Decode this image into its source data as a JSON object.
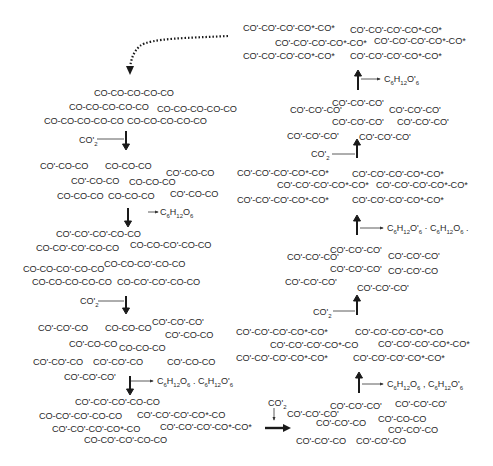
{
  "diagram": {
    "type": "reaction-scheme",
    "colors": {
      "text": "#2a2a2a",
      "arrows": "#1a1a1a",
      "background": "#ffffff"
    }
  },
  "left_column": {
    "block1": [
      "CO-CO-CO-CO-CO",
      "CO-CO-CO-CO-CO",
      "CO-CO-CO-CO-CO",
      "CO-CO-CO-CO-CO",
      "CO-CO-CO-CO-CO"
    ],
    "step1_reagent": "CO'",
    "step1_reagent_sub": "2",
    "block2": [
      "CO'-CO-CO",
      "CO-CO-CO",
      "CO'-CO-CO",
      "CO'-CO-CO",
      "CO-CO-CO",
      "CO-CO-CO",
      "CO-CO-CO",
      "CO'-CO-CO"
    ],
    "step2_product": "C6H12O6",
    "block3": [
      "CO'-CO'-CO'-CO-CO",
      "CO-CO'-CO'-CO-CO",
      "CO-CO-CO'-CO-CO",
      "CO-CO-CO'-CO-CO",
      "CO-CO-CO'-CO-CO",
      "CO-CO-CO-CO-CO",
      "CO-CO'-CO'-CO-CO"
    ],
    "step3_reagent": "CO'",
    "step3_reagent_sub": "2",
    "block4": [
      "CO'-CO'-CO",
      "CO-CO-CO",
      "CO'-CO'-CO'",
      "CO'-CO-CO",
      "CO'-CO-CO",
      "CO-CO-CO",
      "CO'-CO'-CO",
      "CO'-CO'-CO",
      "CO'-CO-CO",
      "CO'-CO'-CO'"
    ],
    "step4_products": "C6H12O6 , C6H12O'6",
    "block5": [
      "CO'-CO'-CO'-CO-CO",
      "CO-CO'-CO'-CO-CO",
      "CO'-CO'-CO'-CO*-CO",
      "CO'-CO'-CO'-CO*-CO",
      "CO'-CO'-CO'-CO*-CO*",
      "CO-CO'-CO'-CO-CO"
    ]
  },
  "bottom_transition": {
    "reagent": "CO'",
    "reagent_sub": "2"
  },
  "right_column": {
    "block1": [
      "CO'-CO'-CO'",
      "CO'-CO'-CO'",
      "CO'-CO'-CO'",
      "CO'-CO'-CO",
      "CO'-CO-CO",
      "CO'-CO'-CO",
      "CO'-CO'-CO",
      "CO'-CO'-CO"
    ],
    "step1_products": "C6H12O6 , C6H12O'6",
    "block2": [
      "CO'-CO'-CO'-CO*-CO*",
      "CO'-CO'-CO'-CO*-CO",
      "CO'-CO'-CO'-CO*-CO",
      "CO'-CO'-CO'-CO*-CO*",
      "CO'-CO'-CO'-CO*-CO*",
      "CO'-CO'-CO'-CO*-CO*"
    ],
    "step2_reagent": "CO'",
    "step2_reagent_sub": "2",
    "block3": [
      "CO'-CO'-CO'",
      "CO'-CO'-CO'",
      "CO'-CO'-CO'",
      "CO'-CO'-CO'",
      "CO'-CO'-CO",
      "CO'-CO'-CO'",
      "CO'-CO'-CO'"
    ],
    "step3_products": "C6H12O'6 , C6H12O6 .",
    "block4": [
      "CO'-CO'-CO'-CO*-CO*",
      "CO'-CO'-CO'-CO*-CO*",
      "CO'-CO'-CO'-CO*-CO*",
      "CO'-CO'-CO'-CO*-CO*",
      "CO'-CO'-CO'-CO*-CO*",
      "CO'-CO'-CO'-CO*-CO*"
    ],
    "step4_reagent": "CO'",
    "step4_reagent_sub": "2",
    "block5": [
      "CO'-CO'-CO'",
      "CO'-CO'-CO'",
      "CO'-CO'-CO'",
      "CO'-CO'-CO'",
      "CO'-CO'-CO'",
      "CO'-CO'-CO'",
      "CO'-CO'-CO'",
      "CO'-CO'-CO'"
    ],
    "step5_product": "C6H12O'6",
    "block6": [
      "CO'-CO'-CO'-CO*-CO*",
      "CO'-CO'-CO'-CO*-CO*",
      "CO'-CO'-CO'-CO*-CO*",
      "CO'-CO'-CO'-CO*-CO*",
      "CO'-CO'-CO'-CO*-CO*",
      "CO'-CO'-CO'-CO*-CO*"
    ]
  }
}
